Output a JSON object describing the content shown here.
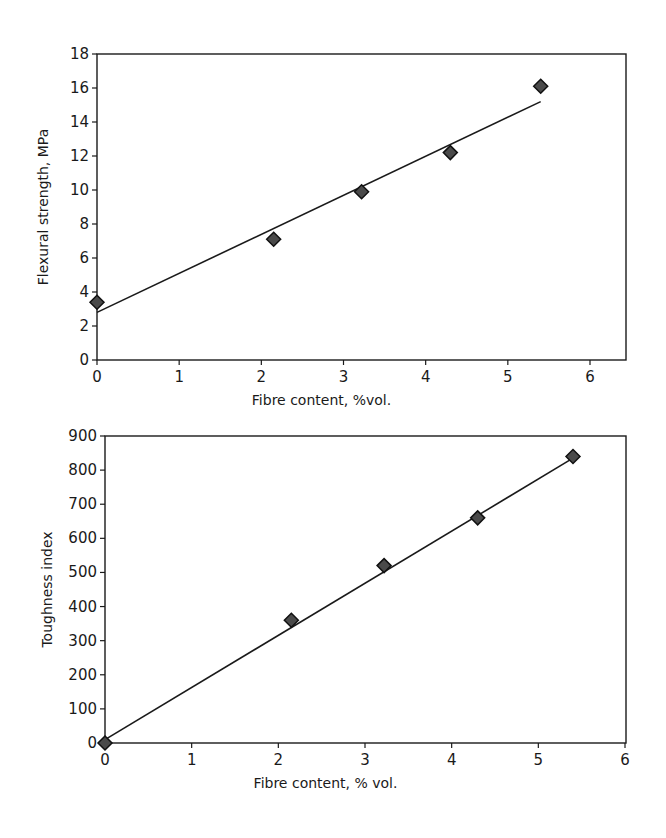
{
  "chart_data": [
    {
      "type": "scatter",
      "title": "",
      "xlabel": "Fibre content, %vol.",
      "ylabel": "Flexural strength, MPa",
      "xlim": [
        0,
        6
      ],
      "ylim": [
        0,
        18
      ],
      "x_ticks": [
        0,
        1,
        2,
        3,
        4,
        5,
        6
      ],
      "y_ticks": [
        0,
        2,
        4,
        6,
        8,
        10,
        12,
        14,
        16,
        18
      ],
      "grid": false,
      "legend": null,
      "series": [
        {
          "name": "Measured",
          "marker": "diamond",
          "x": [
            0,
            2.15,
            3.22,
            4.3,
            5.4
          ],
          "y": [
            3.4,
            7.1,
            9.9,
            12.2,
            16.1
          ]
        },
        {
          "name": "Trend line",
          "style": "line",
          "x": [
            0,
            5.4
          ],
          "y": [
            2.8,
            15.2
          ]
        }
      ]
    },
    {
      "type": "scatter",
      "title": "",
      "xlabel": "Fibre content, % vol.",
      "ylabel": "Toughness index",
      "xlim": [
        0,
        6
      ],
      "ylim": [
        0,
        900
      ],
      "x_ticks": [
        0,
        1,
        2,
        3,
        4,
        5,
        6
      ],
      "y_ticks": [
        0,
        100,
        200,
        300,
        400,
        500,
        600,
        700,
        800,
        900
      ],
      "grid": false,
      "legend": null,
      "series": [
        {
          "name": "Measured",
          "marker": "diamond",
          "x": [
            0,
            2.15,
            3.22,
            4.3,
            5.4
          ],
          "y": [
            0,
            360,
            520,
            660,
            840
          ]
        },
        {
          "name": "Trend line",
          "style": "line",
          "x": [
            0,
            5.4
          ],
          "y": [
            10,
            835
          ]
        }
      ]
    }
  ],
  "layout": {
    "charts": [
      {
        "left": 97,
        "right": 626,
        "top": 54,
        "bottom": 360,
        "xmax_px": 590
      },
      {
        "left": 105,
        "right": 626,
        "top": 436,
        "bottom": 743,
        "xmax_px": 625
      }
    ],
    "colors": {
      "axis": "#1a1a1a",
      "marker_fill": "#4a4a4a",
      "marker_stroke": "#111111",
      "line": "#1a1a1a"
    }
  }
}
